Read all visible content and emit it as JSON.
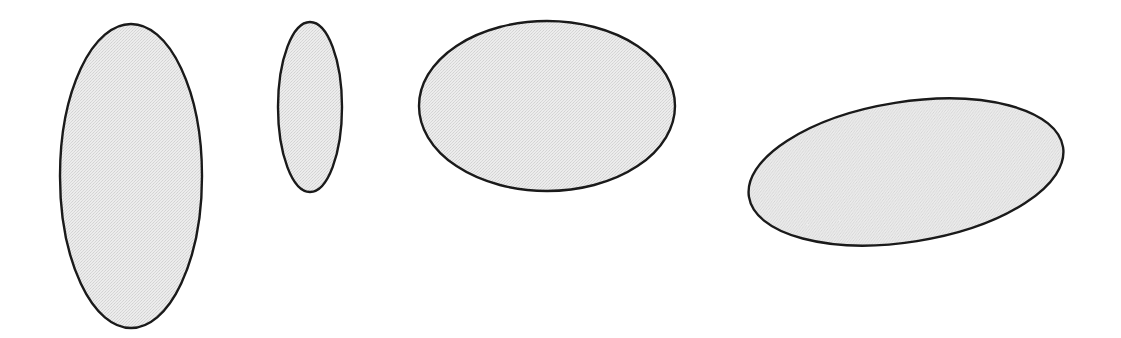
{
  "figure": {
    "title": "",
    "caption": "",
    "background_color": "#ffffff",
    "width": 1121,
    "height": 338,
    "style": {
      "stroke_color": "#1a1a1a",
      "fill_color": "#e4e4e4",
      "fill_pattern": "halftone-dither",
      "stroke_width": 2.4
    },
    "shape_count": 4
  },
  "chart_data": {
    "type": "scatter",
    "title": "",
    "xlabel": "",
    "ylabel": "",
    "grid": false,
    "legend": "none",
    "xlim": [
      0,
      1121
    ],
    "ylim": [
      338,
      0
    ],
    "shapes": [
      {
        "index": 1,
        "name": "ellipse-tall-narrow",
        "label": "",
        "cx": 131,
        "cy": 176,
        "rx": 71,
        "ry": 152,
        "rotation_deg": 0,
        "aspect_ratio": 0.47,
        "fill": "#e4e4e4",
        "stroke": "#1a1a1a"
      },
      {
        "index": 2,
        "name": "ellipse-small-narrow",
        "label": "",
        "cx": 310,
        "cy": 107,
        "rx": 32,
        "ry": 85,
        "rotation_deg": 0,
        "aspect_ratio": 0.38,
        "fill": "#e4e4e4",
        "stroke": "#1a1a1a"
      },
      {
        "index": 3,
        "name": "ellipse-wide-horizontal",
        "label": "",
        "cx": 547,
        "cy": 106,
        "rx": 128,
        "ry": 85,
        "rotation_deg": 0,
        "aspect_ratio": 1.51,
        "fill": "#e4e4e4",
        "stroke": "#1a1a1a"
      },
      {
        "index": 4,
        "name": "ellipse-wide-tilted",
        "label": "",
        "cx": 906,
        "cy": 172,
        "rx": 159,
        "ry": 70,
        "rotation_deg": -9,
        "aspect_ratio": 2.27,
        "fill": "#e4e4e4",
        "stroke": "#1a1a1a"
      }
    ]
  }
}
